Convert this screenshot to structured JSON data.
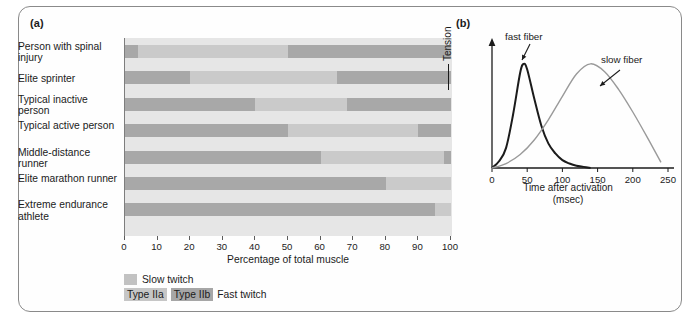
{
  "figure": {
    "panel_a_label": "(a)",
    "panel_b_label": "(b)"
  },
  "panel_a": {
    "x_title": "Percentage of total muscle",
    "x_ticks": [
      "0",
      "10",
      "20",
      "30",
      "40",
      "50",
      "60",
      "70",
      "80",
      "90",
      "100"
    ],
    "legend": {
      "slow_label": "Slow twitch",
      "type_iia_label": "Type IIa",
      "type_iib_label": "Type IIb",
      "fast_label": "Fast twitch"
    },
    "colors": {
      "slow": "#a8a8a8",
      "type_iia": "#cacaca",
      "type_iib": "#a8a8a8",
      "plot_background": "#e6e6e6"
    }
  },
  "panel_b": {
    "y_axis_title": "Tension",
    "x_title_line1": "Time after activation",
    "x_title_line2": "(msec)",
    "x_ticks": [
      "0",
      "50",
      "100",
      "150",
      "200",
      "250"
    ],
    "annotations": {
      "fast_fiber": "fast fiber",
      "slow_fiber": "slow fiber"
    },
    "colors": {
      "fast_curve": "#1b1b1b",
      "slow_curve": "#9a9a9a"
    }
  },
  "chart_data": [
    {
      "type": "bar",
      "orientation": "horizontal",
      "stacked": true,
      "title": "",
      "xlabel": "Percentage of total muscle",
      "ylabel": "",
      "xlim": [
        0,
        100
      ],
      "grid": false,
      "legend_position": "below",
      "categories": [
        "Person with spinal injury",
        "Elite sprinter",
        "Typical inactive person",
        "Typical active person",
        "Middle-distance runner",
        "Elite marathon runner",
        "Extreme endurance athlete"
      ],
      "series": [
        {
          "name": "Slow twitch",
          "values": [
            4,
            20,
            40,
            50,
            60,
            80,
            95
          ]
        },
        {
          "name": "Type IIa",
          "values": [
            46,
            45,
            28,
            40,
            38,
            20,
            5
          ]
        },
        {
          "name": "Type IIb",
          "values": [
            50,
            35,
            32,
            10,
            2,
            0,
            0
          ]
        }
      ]
    },
    {
      "type": "line",
      "title": "",
      "xlabel": "Time after activation (msec)",
      "ylabel": "Tension",
      "xlim": [
        0,
        250
      ],
      "ylim": [
        0,
        1
      ],
      "grid": false,
      "legend_position": "annotations",
      "series": [
        {
          "name": "fast fiber",
          "peak_x": 45,
          "x": [
            0,
            10,
            20,
            30,
            40,
            45,
            50,
            60,
            70,
            80,
            90,
            100,
            110,
            120,
            130,
            140
          ],
          "y": [
            0.0,
            0.06,
            0.18,
            0.48,
            0.85,
            0.93,
            0.88,
            0.62,
            0.38,
            0.22,
            0.13,
            0.07,
            0.04,
            0.02,
            0.01,
            0.0
          ]
        },
        {
          "name": "slow fiber",
          "peak_x": 140,
          "x": [
            0,
            20,
            40,
            60,
            80,
            100,
            120,
            140,
            160,
            180,
            200,
            220,
            240
          ],
          "y": [
            0.0,
            0.04,
            0.12,
            0.25,
            0.43,
            0.64,
            0.84,
            0.93,
            0.86,
            0.7,
            0.5,
            0.28,
            0.05
          ]
        }
      ]
    }
  ]
}
